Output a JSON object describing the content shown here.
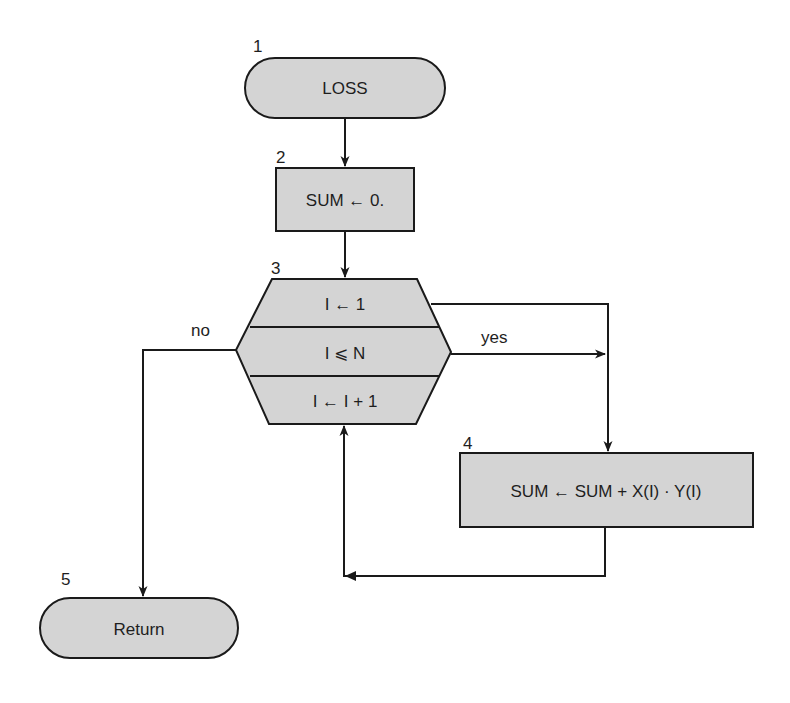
{
  "diagram": {
    "type": "flowchart",
    "colors": {
      "shape_fill": "#d4d4d4",
      "stroke": "#1a1a1a",
      "background": "#ffffff"
    },
    "nodes": [
      {
        "id": 1,
        "number": "1",
        "shape": "terminal",
        "text": "LOSS"
      },
      {
        "id": 2,
        "number": "2",
        "shape": "process",
        "text": "SUM ← 0."
      },
      {
        "id": 3,
        "number": "3",
        "shape": "loop-hexagon",
        "sections": {
          "init": "I ← 1",
          "test": "I ⩽ N",
          "increment": "I ← I + 1"
        }
      },
      {
        "id": 4,
        "number": "4",
        "shape": "process",
        "text": "SUM ← SUM + X(I) · Y(I)"
      },
      {
        "id": 5,
        "number": "5",
        "shape": "terminal",
        "text": "Return"
      }
    ],
    "edges": [
      {
        "from": 1,
        "to": 2,
        "label": ""
      },
      {
        "from": 2,
        "to": 3,
        "label": ""
      },
      {
        "from": 3,
        "to": 4,
        "label": "yes"
      },
      {
        "from": 3,
        "to": 5,
        "label": "no"
      },
      {
        "from": 4,
        "to": 3,
        "label": ""
      }
    ],
    "labels": {
      "yes": "yes",
      "no": "no"
    }
  }
}
